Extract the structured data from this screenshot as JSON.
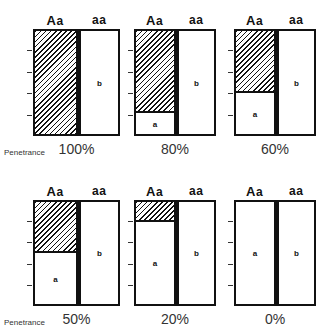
{
  "figure": {
    "penetrance_label": "Penetrance",
    "genotype_left": "Aa",
    "genotype_left_big": "A",
    "genotype_left_small": "a",
    "genotype_right": "aa",
    "region_a_label": "a",
    "region_b_label": "b",
    "panels": [
      {
        "penetrance": "100%",
        "hatched_fraction": 1.0
      },
      {
        "penetrance": "80%",
        "hatched_fraction": 0.8
      },
      {
        "penetrance": "60%",
        "hatched_fraction": 0.6
      },
      {
        "penetrance": "50%",
        "hatched_fraction": 0.5
      },
      {
        "penetrance": "20%",
        "hatched_fraction": 0.2
      },
      {
        "penetrance": "0%",
        "hatched_fraction": 0.0
      }
    ]
  },
  "chart_data": {
    "type": "bar",
    "title": "",
    "categories": [
      "100%",
      "80%",
      "60%",
      "50%",
      "20%",
      "0%"
    ],
    "series": [
      {
        "name": "Aa affected (hatched)",
        "values": [
          100,
          80,
          60,
          50,
          20,
          0
        ]
      },
      {
        "name": "Aa unaffected (a)",
        "values": [
          0,
          20,
          40,
          50,
          80,
          100
        ]
      },
      {
        "name": "aa unaffected (b)",
        "values": [
          100,
          100,
          100,
          100,
          100,
          100
        ]
      }
    ],
    "xlabel": "Penetrance",
    "ylabel": "",
    "ylim": [
      0,
      100
    ]
  }
}
